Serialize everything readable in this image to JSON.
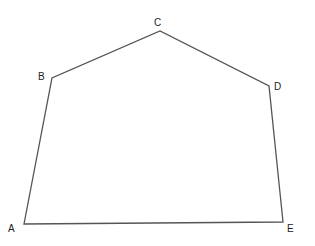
{
  "diagram": {
    "type": "polygon",
    "name": "Pentagon ABCDE",
    "stroke_color": "#555555",
    "vertices": [
      {
        "label": "A",
        "x": 24,
        "y": 224,
        "lx": 8,
        "ly": 232
      },
      {
        "label": "B",
        "x": 52,
        "y": 78,
        "lx": 38,
        "ly": 80
      },
      {
        "label": "C",
        "x": 160,
        "y": 31,
        "lx": 154,
        "ly": 26
      },
      {
        "label": "D",
        "x": 269,
        "y": 86,
        "lx": 274,
        "ly": 90
      },
      {
        "label": "E",
        "x": 283,
        "y": 222,
        "lx": 287,
        "ly": 232
      }
    ]
  }
}
